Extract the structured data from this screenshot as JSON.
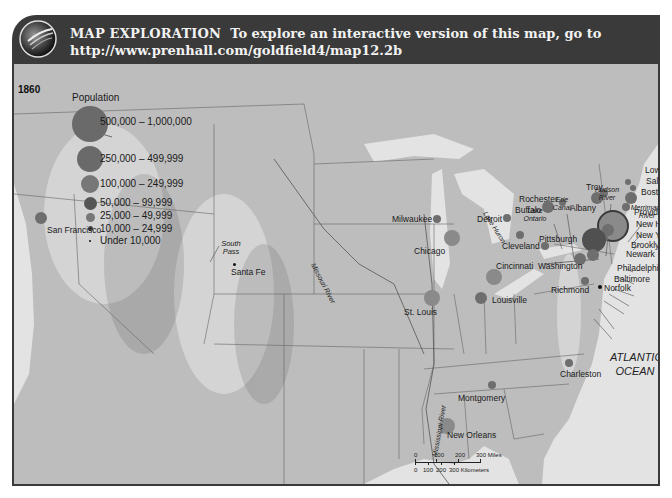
{
  "header": {
    "lead": "MAP EXPLORATION",
    "text": "To explore an interactive version of this map, go to",
    "url": "http://www.prenhall.com/goldfield4/map12.2b",
    "icon": "globe-icon"
  },
  "map": {
    "year": "1860",
    "legend": {
      "title": "Population",
      "items": [
        {
          "label": "500,000 – 1,000,000",
          "size": 36
        },
        {
          "label": "250,000 – 499,999",
          "size": 26
        },
        {
          "label": "100,000 – 249,999",
          "size": 18
        },
        {
          "label": "50,000 – 99,999",
          "size": 13
        },
        {
          "label": "25,000 – 49,999",
          "size": 9
        },
        {
          "label": "10,000 – 24,999",
          "size": 5
        },
        {
          "label": "Under 10,000",
          "size": 2
        }
      ]
    },
    "cities": [
      {
        "name": "San Francisco",
        "x": 27,
        "y": 216,
        "r": 6,
        "lx": 33,
        "ly": 223
      },
      {
        "name": "Santa Fe",
        "x": 220,
        "y": 262,
        "r": 1.5,
        "lx": 217,
        "ly": 265
      },
      {
        "name": "Milwaukee",
        "x": 423,
        "y": 217,
        "r": 4,
        "lx": 378,
        "ly": 212
      },
      {
        "name": "Chicago",
        "x": 438,
        "y": 236,
        "r": 8,
        "lx": 400,
        "ly": 244
      },
      {
        "name": "Detroit",
        "x": 493,
        "y": 216,
        "r": 4,
        "lx": 463,
        "ly": 212
      },
      {
        "name": "Cleveland",
        "x": 506,
        "y": 233,
        "r": 4,
        "lx": 488,
        "ly": 239
      },
      {
        "name": "Cincinnati",
        "x": 480,
        "y": 275,
        "r": 8,
        "lx": 482,
        "ly": 259
      },
      {
        "name": "St. Louis",
        "x": 418,
        "y": 296,
        "r": 8,
        "lx": 390,
        "ly": 305
      },
      {
        "name": "Louisville",
        "x": 467,
        "y": 296,
        "r": 6,
        "lx": 478,
        "ly": 293
      },
      {
        "name": "Rochester",
        "x": 548,
        "y": 200,
        "r": 3.5,
        "lx": 505,
        "ly": 192
      },
      {
        "name": "Buffalo",
        "x": 534,
        "y": 205,
        "r": 6,
        "lx": 501,
        "ly": 203
      },
      {
        "name": "Pittsburgh",
        "x": 531,
        "y": 244,
        "r": 4,
        "lx": 525,
        "ly": 232
      },
      {
        "name": "Washington",
        "x": 566,
        "y": 257,
        "r": 6,
        "lx": 524,
        "ly": 259
      },
      {
        "name": "Richmond",
        "x": 571,
        "y": 279,
        "r": 4,
        "lx": 537,
        "ly": 283
      },
      {
        "name": "Norfolk",
        "x": 586,
        "y": 285,
        "r": 2,
        "lx": 590,
        "ly": 281
      },
      {
        "name": "Albany",
        "x": 583,
        "y": 196,
        "r": 6,
        "lx": 556,
        "ly": 201
      },
      {
        "name": "Troy",
        "x": 590,
        "y": 191,
        "r": 4,
        "lx": 572,
        "ly": 180
      },
      {
        "name": "Lowell",
        "x": 614,
        "y": 180,
        "r": 3,
        "lx": 631,
        "ly": 163
      },
      {
        "name": "Salem",
        "x": 619,
        "y": 186,
        "r": 3,
        "lx": 632,
        "ly": 174
      },
      {
        "name": "Boston",
        "x": 617,
        "y": 196,
        "r": 6,
        "lx": 627,
        "ly": 185
      },
      {
        "name": "Providence",
        "x": 612,
        "y": 205,
        "r": 4,
        "lx": 620,
        "ly": 205
      },
      {
        "name": "New Haven",
        "x": 603,
        "y": 213,
        "r": 3,
        "lx": 622,
        "ly": 217
      },
      {
        "name": "New York",
        "x": 597,
        "y": 222,
        "r": 14,
        "lx": 622,
        "ly": 228
      },
      {
        "name": "Brooklyn",
        "x": 594,
        "y": 228,
        "r": 6,
        "lx": 617,
        "ly": 238
      },
      {
        "name": "Newark",
        "x": 590,
        "y": 236,
        "r": 4,
        "lx": 612,
        "ly": 247
      },
      {
        "name": "Philadelphia",
        "x": 580,
        "y": 238,
        "r": 12,
        "lx": 603,
        "ly": 261
      },
      {
        "name": "Baltimore",
        "x": 579,
        "y": 253,
        "r": 6,
        "lx": 600,
        "ly": 272
      },
      {
        "name": "Charleston",
        "x": 555,
        "y": 361,
        "r": 4,
        "lx": 546,
        "ly": 367
      },
      {
        "name": "Montgomery",
        "x": 478,
        "y": 383,
        "r": 4,
        "lx": 444,
        "ly": 391
      },
      {
        "name": "New Orleans",
        "x": 433,
        "y": 424,
        "r": 8,
        "lx": 433,
        "ly": 428
      }
    ],
    "features": [
      {
        "name": "South Pass",
        "lx": 205,
        "ly": 178,
        "type": "place"
      },
      {
        "name": "Missouri River",
        "lx": 310,
        "ly": 188,
        "type": "river"
      },
      {
        "name": "Mississippi River",
        "lx": 420,
        "ly": 360,
        "type": "river"
      },
      {
        "name": "Lake Huron",
        "lx": 478,
        "ly": 160,
        "type": "water"
      },
      {
        "name": "Lake Ontario",
        "lx": 515,
        "ly": 150,
        "type": "water"
      },
      {
        "name": "Erie Canal",
        "lx": 543,
        "ly": 140,
        "type": "water"
      },
      {
        "name": "Hudson River",
        "lx": 585,
        "ly": 130,
        "type": "water"
      },
      {
        "name": "Merrimack River",
        "lx": 628,
        "ly": 148,
        "type": "water"
      }
    ],
    "ocean": "ATLANTIC OCEAN",
    "scale": {
      "miles": [
        "0",
        "100",
        "200",
        "300 Miles"
      ],
      "km": [
        "0",
        "100",
        "200",
        "300 Kilometers"
      ]
    }
  },
  "colors": {
    "header_bg": "#3a3a3a",
    "land": "#bdbdbd",
    "water": "#e3e3e3",
    "circle": "#6e6e6e"
  }
}
